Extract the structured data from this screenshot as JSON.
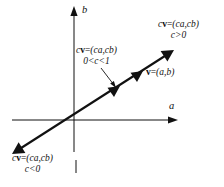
{
  "figure": {
    "background_color": "#ffffff",
    "stroke_color": "#111111",
    "axes": {
      "horizontal_label": "a",
      "vertical_label": "b",
      "origin": {
        "x": 74,
        "y": 120
      }
    },
    "labels": {
      "top_right": {
        "line1": "cv=(ca,cb)",
        "line2": "c>0"
      },
      "middle": {
        "line1": "cv=(ca,cb)",
        "line2": "0<c<1"
      },
      "vector": {
        "line1": "v=(a,b)"
      },
      "bottom_left": {
        "line1": "cv=(ca,cb)",
        "line2": "c<0"
      }
    }
  }
}
